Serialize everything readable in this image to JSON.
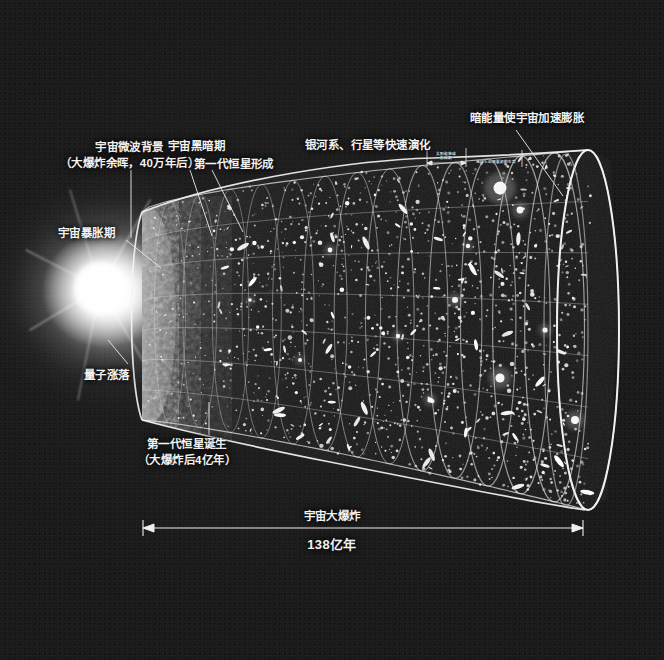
{
  "figure": {
    "title_text": "宇宙大爆炸",
    "duration_text": "138亿年",
    "background_color": "#1b1b1b",
    "ink_color": "#f2f2f2"
  },
  "labels": {
    "cmb_line1": "宇宙微波背景",
    "cmb_line2": "（大爆炸余晖，40万年后）",
    "dark_age": "宇宙黑暗期",
    "first_star_form": "第一代恒星形成",
    "galaxy_evolution": "银河系、行星等快速演化",
    "dark_energy": "暗能量使宇宙加速膨胀",
    "inflation": "宇宙暴胀期",
    "quantum": "量子涨落",
    "first_star_born_line1": "第一代恒星诞生",
    "first_star_born_line2": "（大爆炸后4亿年）"
  },
  "inset_labels": {
    "sun_earth_line1": "太阳和地球",
    "sun_earth_line2": "形成期",
    "earth_life": "地球上出现最初的生命"
  },
  "scalebar": {
    "caption_top": "宇宙大爆炸",
    "caption_bottom": "138亿年",
    "x_start": 143,
    "x_end": 583,
    "y": 528
  },
  "chart_data": {
    "type": "diagram",
    "title": "宇宙大爆炸 138亿年",
    "axis": {
      "label": "138亿年",
      "from": "大爆炸",
      "to": "现在"
    },
    "stages": [
      {
        "name": "量子涨落",
        "x_frac": 0.0
      },
      {
        "name": "宇宙暴胀期",
        "x_frac": 0.02
      },
      {
        "name": "宇宙微波背景（大爆炸余晖，40万年后）",
        "x_frac": 0.08
      },
      {
        "name": "宇宙黑暗期",
        "x_frac": 0.16
      },
      {
        "name": "第一代恒星形成",
        "x_frac": 0.24
      },
      {
        "name": "第一代恒星诞生（大爆炸后4亿年）",
        "x_frac": 0.27
      },
      {
        "name": "银河系、行星等快速演化",
        "x_frac": 0.5
      },
      {
        "name": "太阳和地球形成期",
        "x_frac": 0.66
      },
      {
        "name": "地球上出现最初的生命",
        "x_frac": 0.76
      },
      {
        "name": "暗能量使宇宙加速膨胀",
        "x_frac": 0.92
      }
    ]
  }
}
